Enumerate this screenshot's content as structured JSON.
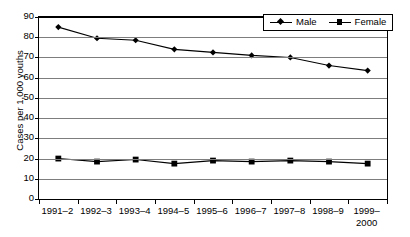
{
  "chart_data": {
    "type": "line",
    "title": "",
    "xlabel": "",
    "ylabel": "Cases per 1,000 youths",
    "ylim": [
      0,
      90
    ],
    "ytick_step": 10,
    "yticks": [
      90,
      80,
      70,
      60,
      50,
      40,
      30,
      20,
      10,
      0
    ],
    "grid": true,
    "legend_position": "top-right",
    "categories": [
      "1991–2",
      "1992–3",
      "1993–4",
      "1994–5",
      "1995–6",
      "1996–7",
      "1997–8",
      "1998–9",
      "1999–\n2000"
    ],
    "series": [
      {
        "name": "Male",
        "marker": "diamond",
        "color": "#000000",
        "values": [
          85.0,
          79.5,
          78.5,
          74.0,
          72.5,
          71.0,
          70.0,
          66.0,
          63.5
        ]
      },
      {
        "name": "Female",
        "marker": "square",
        "color": "#000000",
        "values": [
          20.0,
          18.5,
          19.5,
          17.5,
          19.0,
          18.5,
          19.0,
          18.5,
          17.5
        ]
      }
    ]
  },
  "legend": {
    "entries": [
      {
        "label": "Male",
        "marker": "diamond-marker-icon"
      },
      {
        "label": "Female",
        "marker": "square-marker-icon"
      }
    ]
  },
  "axes": {
    "y_title": "Cases per 1,000 youths"
  }
}
